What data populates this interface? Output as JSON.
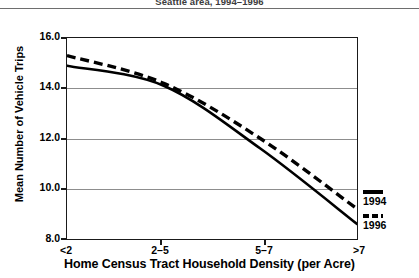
{
  "figure": {
    "title": "Seattle area, 1994–1996"
  },
  "chart_data": {
    "type": "line",
    "title": "Seattle area, 1994–1996",
    "xlabel": "Home Census Tract Household Density (per Acre)",
    "ylabel": "Mean Number of Vehicle Trips",
    "categories": [
      "<2",
      "2–5",
      "5–7",
      ">7"
    ],
    "yticks": [
      "16.0",
      "14.0",
      "12.0",
      "10.0",
      "8.0"
    ],
    "ytick_values": [
      16.0,
      14.0,
      12.0,
      10.0,
      8.0
    ],
    "ylim": [
      8.0,
      16.0
    ],
    "grid": "horizontal",
    "legend_position": "right",
    "series": [
      {
        "name": "1994",
        "style": "solid",
        "color": "#000000",
        "values": [
          14.9,
          14.1,
          11.6,
          8.6
        ]
      },
      {
        "name": "1996",
        "style": "dashed",
        "color": "#000000",
        "values": [
          15.3,
          14.2,
          12.0,
          9.2
        ]
      }
    ]
  },
  "legend": {
    "items": [
      {
        "label": "1994",
        "style": "solid"
      },
      {
        "label": "1996",
        "style": "dashed"
      }
    ]
  }
}
